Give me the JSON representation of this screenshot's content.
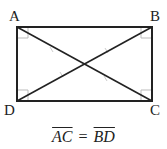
{
  "diagram": {
    "vertices": {
      "A": {
        "label": "A",
        "x": 17,
        "y": 27
      },
      "B": {
        "label": "B",
        "x": 152,
        "y": 27
      },
      "C": {
        "label": "C",
        "x": 152,
        "y": 101
      },
      "D": {
        "label": "D",
        "x": 17,
        "y": 101
      }
    },
    "diagonals": [
      "AC",
      "BD"
    ],
    "right_angle_marks": [
      "A",
      "B",
      "C",
      "D"
    ],
    "equation": {
      "left": "AC",
      "sign": "=",
      "right": "BD"
    },
    "colors": {
      "stroke": "#222222",
      "mark": "#bbbbbb"
    }
  }
}
